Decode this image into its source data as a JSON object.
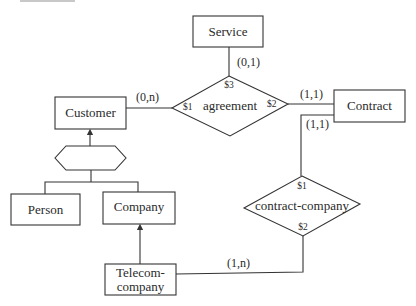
{
  "diagram": {
    "type": "ER diagram",
    "entities": [
      {
        "id": "service",
        "label": "Service"
      },
      {
        "id": "customer",
        "label": "Customer"
      },
      {
        "id": "contract",
        "label": "Contract"
      },
      {
        "id": "person",
        "label": "Person"
      },
      {
        "id": "company",
        "label": "Company"
      },
      {
        "id": "telecom",
        "label_line1": "Telecom-",
        "label_line2": "company"
      }
    ],
    "relationships": [
      {
        "id": "agreement",
        "label": "agreement",
        "roles": {
          "s1": "$1",
          "s2": "$2",
          "s3": "$3"
        }
      },
      {
        "id": "contract_company",
        "label": "contract-company",
        "roles": {
          "s1": "$1",
          "s2": "$2"
        }
      }
    ],
    "cardinalities": {
      "service_agreement": "(0,1)",
      "customer_agreement": "(0,n)",
      "contract_agreement": "(1,1)",
      "contract_contract_company": "(1,1)",
      "telecom_contract_company": "(1,n)"
    },
    "generalization": {
      "parent": "Customer",
      "children": [
        "Person",
        "Company"
      ],
      "subset": {
        "parent": "Company",
        "child": "Telecom-company"
      }
    }
  }
}
